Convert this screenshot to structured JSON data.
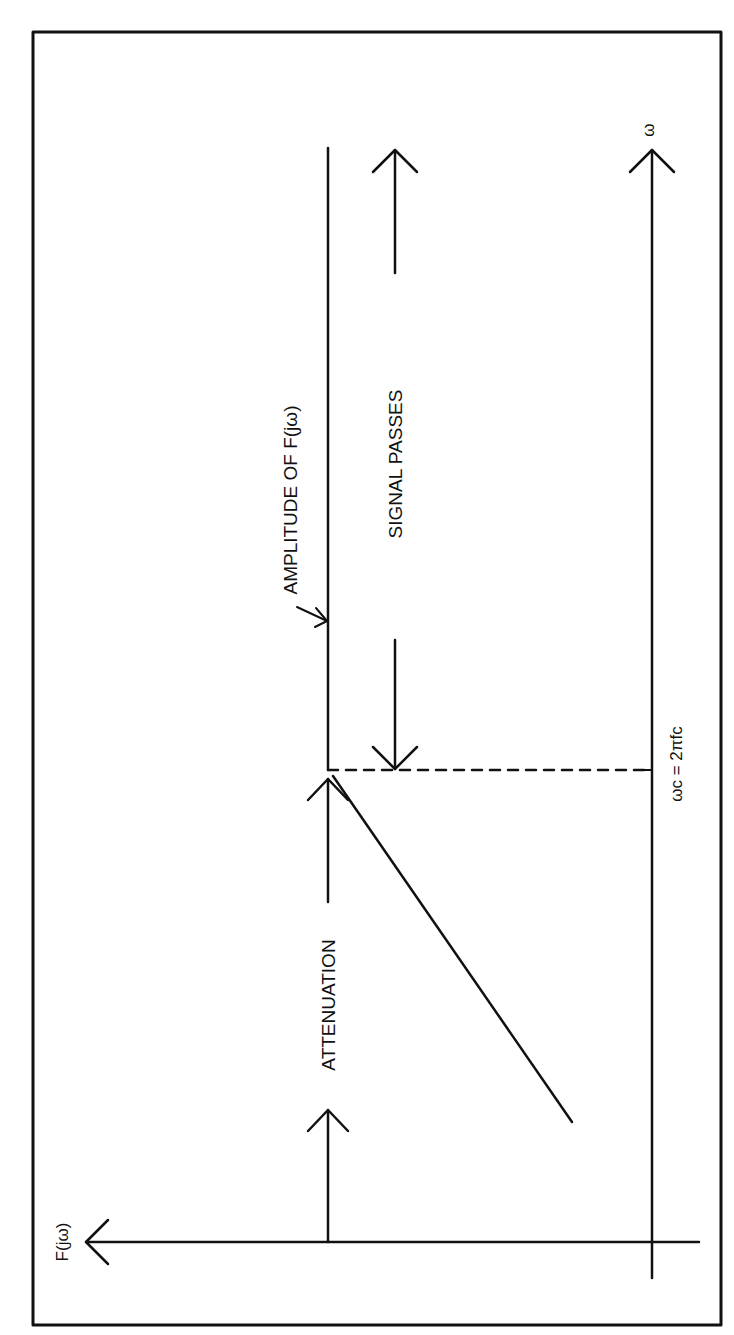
{
  "diagram": {
    "labels": {
      "amplitude": "AMPLITUDE OF F(jω)",
      "signal_passes": "SIGNAL PASSES",
      "attenuation": "ATTENUATION",
      "cutoff": "ωc = 2πfc",
      "x_axis": "ω",
      "y_axis": "F(jω)"
    },
    "colors": {
      "ink": "#111111",
      "background": "#ffffff"
    }
  }
}
